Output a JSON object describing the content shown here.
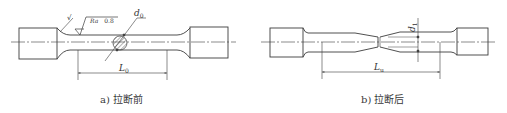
{
  "diagram": {
    "line_color": "#3c3c3c",
    "panels": [
      {
        "id": "a",
        "caption": "a) 拉断前",
        "labels": {
          "original_diameter": "d",
          "original_diameter_sub": "0",
          "original_gauge_length": "L",
          "original_gauge_length_sub": "0",
          "roughness_prefix": "Ra",
          "roughness_value": "0.8",
          "fillet_mark": "√"
        }
      },
      {
        "id": "b",
        "caption": "b) 拉断后",
        "labels": {
          "final_diameter": "d",
          "final_diameter_sub": "1",
          "final_gauge_length": "L",
          "final_gauge_length_sub": "u"
        }
      }
    ]
  }
}
